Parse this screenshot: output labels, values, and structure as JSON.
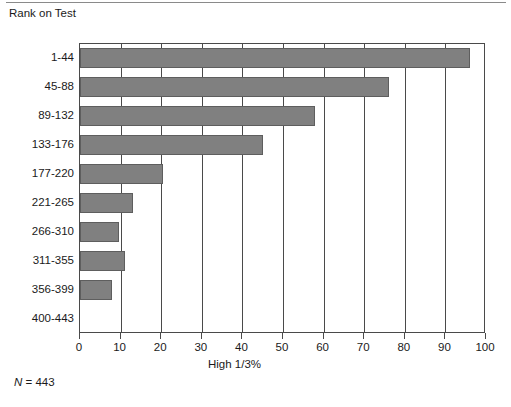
{
  "chart_data": {
    "type": "bar",
    "orientation": "horizontal",
    "title": "Rank on Test",
    "xlabel": "High 1/3%",
    "ylabel": "",
    "categories": [
      "1-44",
      "45-88",
      "89-132",
      "133-176",
      "177-220",
      "221-265",
      "266-310",
      "311-355",
      "356-399",
      "400-443"
    ],
    "values": [
      96,
      76,
      58,
      45,
      20.5,
      13,
      9.5,
      11,
      8,
      0
    ],
    "xlim": [
      0,
      100
    ],
    "xticks": [
      0,
      10,
      20,
      30,
      40,
      50,
      60,
      70,
      80,
      90,
      100
    ],
    "xtick_labels": [
      "0",
      "10",
      "20",
      "30",
      "40",
      "50",
      "60",
      "70",
      "80",
      "90",
      "100"
    ],
    "grid": "vertical",
    "legend": "none",
    "annotations": [
      "N = 443"
    ],
    "bar_color": "#808080",
    "bar_border_color": "#5e5e5e",
    "axis_color": "#4a4a4a"
  },
  "note": {
    "n_symbol": "N",
    "n_text": " = 443"
  }
}
